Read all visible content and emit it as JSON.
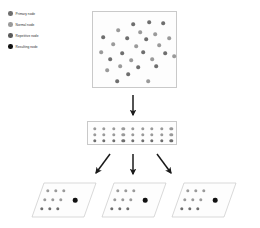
{
  "figure": {
    "type": "diagram"
  },
  "legend": {
    "items": [
      {
        "label": "Primary node",
        "color": "#6e6e6e",
        "icon": "filled-circle-icon"
      },
      {
        "label": "Normal node",
        "color": "#9a9a9a",
        "icon": "filled-circle-icon"
      },
      {
        "label": "Repetitive node",
        "color": "#5a5a5a",
        "icon": "filled-circle-icon"
      },
      {
        "label": "Resulting node",
        "color": "#111111",
        "icon": "filled-circle-icon"
      }
    ]
  },
  "colors": {
    "node_primary": "#6e6e6e",
    "node_normal": "#9a9a9a",
    "node_repetitive": "#5a5a5a",
    "node_result": "#111111",
    "panel_border": "#c9c9c9",
    "panel_fill": "#fdfdfd",
    "arrow": "#1a1a1a",
    "page_background": "#ffffff"
  },
  "scatter_panel": {
    "name": "source-node-cloud",
    "node_count": 28,
    "nodes": [
      {
        "x": 40,
        "y": 12,
        "shade": "dark"
      },
      {
        "x": 56,
        "y": 10,
        "shade": "dark"
      },
      {
        "x": 70,
        "y": 11,
        "shade": "dark"
      },
      {
        "x": 25,
        "y": 18,
        "shade": "light"
      },
      {
        "x": 47,
        "y": 20,
        "shade": "light"
      },
      {
        "x": 62,
        "y": 22,
        "shade": "light"
      },
      {
        "x": 10,
        "y": 25,
        "shade": "dark"
      },
      {
        "x": 34,
        "y": 26,
        "shade": "dark"
      },
      {
        "x": 53,
        "y": 27,
        "shade": "dark"
      },
      {
        "x": 76,
        "y": 26,
        "shade": "light"
      },
      {
        "x": 20,
        "y": 32,
        "shade": "light"
      },
      {
        "x": 43,
        "y": 34,
        "shade": "light"
      },
      {
        "x": 66,
        "y": 33,
        "shade": "light"
      },
      {
        "x": 8,
        "y": 40,
        "shade": "light"
      },
      {
        "x": 29,
        "y": 41,
        "shade": "dark"
      },
      {
        "x": 50,
        "y": 40,
        "shade": "dark"
      },
      {
        "x": 72,
        "y": 41,
        "shade": "dark"
      },
      {
        "x": 17,
        "y": 47,
        "shade": "dark"
      },
      {
        "x": 38,
        "y": 48,
        "shade": "light"
      },
      {
        "x": 59,
        "y": 47,
        "shade": "light"
      },
      {
        "x": 81,
        "y": 44,
        "shade": "light"
      },
      {
        "x": 27,
        "y": 54,
        "shade": "light"
      },
      {
        "x": 45,
        "y": 55,
        "shade": "dark"
      },
      {
        "x": 63,
        "y": 54,
        "shade": "dark"
      },
      {
        "x": 14,
        "y": 58,
        "shade": "light"
      },
      {
        "x": 35,
        "y": 62,
        "shade": "dark"
      },
      {
        "x": 24,
        "y": 69,
        "shade": "dark"
      },
      {
        "x": 55,
        "y": 69,
        "shade": "light"
      }
    ]
  },
  "grid_panel": {
    "name": "normalized-node-grid",
    "columns": 9,
    "rows": 3,
    "node_count": 27,
    "row_shades": [
      "light",
      "light",
      "dark"
    ]
  },
  "planes": [
    {
      "name": "sampled-plane-1",
      "grid": {
        "columns": 3,
        "rows": 3,
        "node_count": 9
      },
      "result_node": {
        "label": "Resulting node",
        "shade": "result"
      }
    },
    {
      "name": "sampled-plane-2",
      "grid": {
        "columns": 3,
        "rows": 3,
        "node_count": 9
      },
      "result_node": {
        "label": "Resulting node",
        "shade": "result"
      }
    },
    {
      "name": "sampled-plane-3",
      "grid": {
        "columns": 3,
        "rows": 3,
        "node_count": 9
      },
      "result_node": {
        "label": "Resulting node",
        "shade": "result"
      }
    }
  ],
  "arrows": [
    {
      "name": "arrow-scatter-to-grid",
      "direction": "down"
    },
    {
      "name": "arrow-grid-to-plane-1",
      "direction": "down-left"
    },
    {
      "name": "arrow-grid-to-plane-2",
      "direction": "down"
    },
    {
      "name": "arrow-grid-to-plane-3",
      "direction": "down-right"
    }
  ]
}
